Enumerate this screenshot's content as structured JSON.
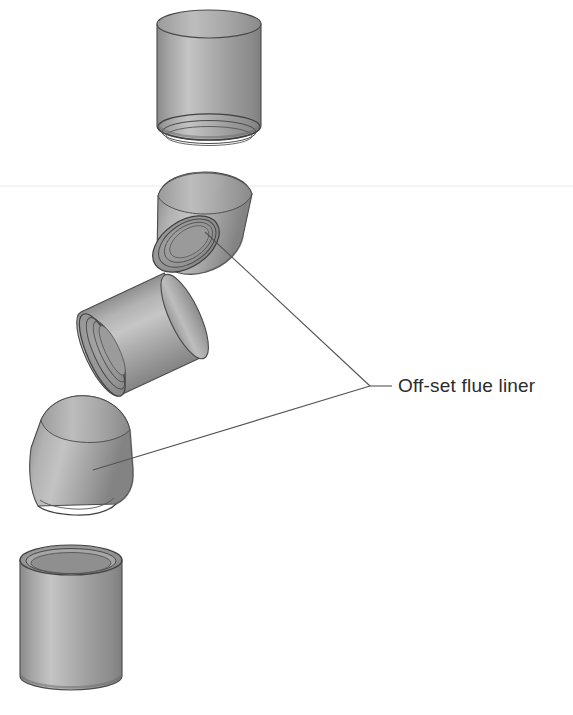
{
  "document": {
    "kind": "technical-illustration",
    "subject": "Off-set flue liner assembly",
    "background_color": "#ffffff"
  },
  "annotations": {
    "label_text": "Off-set flue liner",
    "label_color": "#2b2b2b",
    "leader_color": "#555555",
    "leader_vertex": {
      "x": 370,
      "y": 386
    },
    "leader_stub_end": {
      "x": 392,
      "y": 386
    },
    "leaders": [
      {
        "name": "leader-to-upper-bend",
        "from_x": 370,
        "from_y": 386,
        "to_x": 205,
        "to_y": 232
      },
      {
        "name": "leader-to-lower-bend",
        "from_x": 370,
        "from_y": 386,
        "to_x": 93,
        "to_y": 470
      }
    ]
  },
  "palette": {
    "body_light": "#c9c9c9",
    "body_mid": "#a2a2a2",
    "body_dark": "#7d7d7d",
    "edge_stroke": "#4a4a4a",
    "rim_stroke": "#3f3f3f",
    "socket_inner": "#8d8d8d",
    "socket_shadow": "#6f6f6f",
    "artifact_line": "#e8e8e8"
  },
  "artifact": {
    "name": "scan-line",
    "y": 186,
    "visible": true
  },
  "components": [
    {
      "id": "top-straight-liner",
      "name": "straight-flue-liner-top",
      "type": "straight",
      "cx": 209,
      "top_y": 10,
      "bottom_y": 140,
      "radius_x": 52,
      "radius_y": 14,
      "tilt_deg": 0,
      "joint": "spigot-bottom"
    },
    {
      "id": "upper-offset-bend",
      "name": "off-set-flue-liner-upper",
      "type": "bend",
      "cx": 195,
      "cy": 228,
      "tilt_deg": -32,
      "radius_x": 48,
      "radius_y": 15,
      "joint": "socket-lower-left"
    },
    {
      "id": "middle-straight-liner",
      "name": "straight-flue-liner-middle",
      "type": "straight",
      "cx": 143,
      "cy": 336,
      "length": 96,
      "radius_x": 46,
      "radius_y": 15,
      "tilt_deg": -25,
      "joint": "socket-lower-left"
    },
    {
      "id": "lower-offset-bend",
      "name": "off-set-flue-liner-lower",
      "type": "bend",
      "cx": 80,
      "cy": 455,
      "tilt_deg": -28,
      "radius_x": 48,
      "radius_y": 15,
      "joint": "socket-bottom"
    },
    {
      "id": "bottom-straight-liner",
      "name": "straight-flue-liner-bottom",
      "type": "straight",
      "cx": 71,
      "top_y": 545,
      "bottom_y": 690,
      "radius_x": 51,
      "radius_y": 15,
      "tilt_deg": 0,
      "joint": "socket-top-open"
    }
  ]
}
